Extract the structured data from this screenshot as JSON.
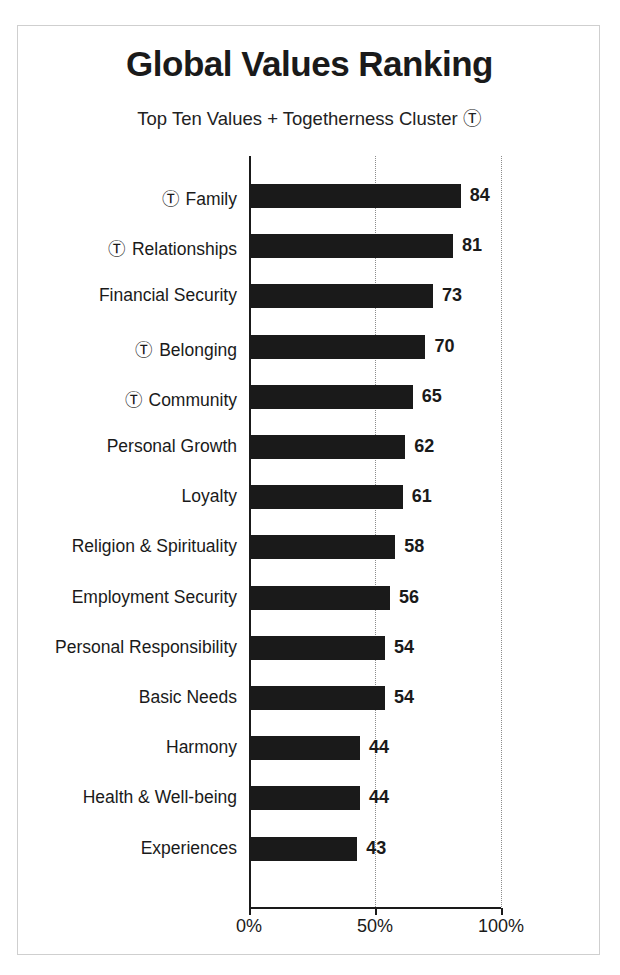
{
  "figure": {
    "title": "Global Values Ranking",
    "subtitle": "Top Ten Values + Togetherness Cluster Ⓣ",
    "cluster_symbol": "Ⓣ",
    "frame_color": "#cfcfcf",
    "bar_color": "#1a1a1a",
    "grid_color": "#8c8c8c",
    "background": "#ffffff"
  },
  "chart_data": {
    "type": "bar",
    "orientation": "horizontal",
    "title": "Global Values Ranking",
    "subtitle": "Top Ten Values + Togetherness Cluster Ⓣ",
    "xlabel": "",
    "ylabel": "",
    "xlim": [
      0,
      100
    ],
    "xticks": [
      0,
      50,
      100
    ],
    "xticklabels": [
      "0%",
      "50%",
      "100%"
    ],
    "grid": "vertical-dotted",
    "legend": null,
    "categories": [
      "Ⓣ Family",
      "Ⓣ Relationships",
      "Financial Security",
      "Ⓣ Belonging",
      "Ⓣ Community",
      "Personal Growth",
      "Loyalty",
      "Religion & Spirituality",
      "Employment Security",
      "Personal Responsibility",
      "Basic Needs",
      "Harmony",
      "Health & Well-being",
      "Experiences"
    ],
    "values": [
      84,
      81,
      73,
      70,
      65,
      62,
      61,
      58,
      56,
      54,
      54,
      44,
      44,
      43
    ],
    "data_labels": [
      "84",
      "81",
      "73",
      "70",
      "65",
      "62",
      "61",
      "58",
      "56",
      "54",
      "54",
      "44",
      "44",
      "43"
    ],
    "in_togetherness_cluster": [
      true,
      true,
      false,
      true,
      true,
      false,
      false,
      false,
      false,
      false,
      false,
      false,
      false,
      false
    ],
    "rows": [
      {
        "label": "Family",
        "marked": true,
        "value": 84,
        "label_text": "Ⓣ Family"
      },
      {
        "label": "Relationships",
        "marked": true,
        "value": 81,
        "label_text": "Ⓣ Relationships"
      },
      {
        "label": "Financial Security",
        "marked": false,
        "value": 73,
        "label_text": "Financial Security"
      },
      {
        "label": "Belonging",
        "marked": true,
        "value": 70,
        "label_text": "Ⓣ Belonging"
      },
      {
        "label": "Community",
        "marked": true,
        "value": 65,
        "label_text": "Ⓣ Community"
      },
      {
        "label": "Personal Growth",
        "marked": false,
        "value": 62,
        "label_text": "Personal Growth"
      },
      {
        "label": "Loyalty",
        "marked": false,
        "value": 61,
        "label_text": "Loyalty"
      },
      {
        "label": "Religion & Spirituality",
        "marked": false,
        "value": 58,
        "label_text": "Religion & Spirituality"
      },
      {
        "label": "Employment Security",
        "marked": false,
        "value": 56,
        "label_text": "Employment Security"
      },
      {
        "label": "Personal Responsibility",
        "marked": false,
        "value": 54,
        "label_text": "Personal Responsibility"
      },
      {
        "label": "Basic Needs",
        "marked": false,
        "value": 54,
        "label_text": "Basic Needs"
      },
      {
        "label": "Harmony",
        "marked": false,
        "value": 44,
        "label_text": "Harmony"
      },
      {
        "label": "Health & Well-being",
        "marked": false,
        "value": 44,
        "label_text": "Health & Well-being"
      },
      {
        "label": "Experiences",
        "marked": false,
        "value": 43,
        "label_text": "Experiences"
      }
    ]
  }
}
